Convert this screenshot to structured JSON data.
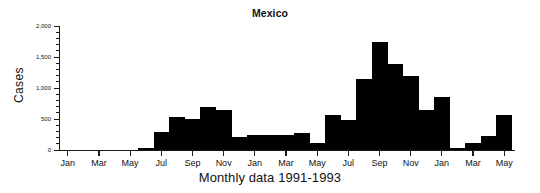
{
  "chart_data": {
    "type": "bar",
    "title": "Mexico",
    "xlabel": "Monthly data 1991-1993",
    "ylabel": "Cases",
    "ylim": [
      0,
      2000
    ],
    "ytick_labels": [
      "0",
      "500",
      "1,000",
      "1,500",
      "2,000"
    ],
    "ytick_values": [
      0,
      500,
      1000,
      1500,
      2000
    ],
    "yminor_step": 100,
    "grid": false,
    "legend": null,
    "categories": [
      "Jan 1991",
      "Feb 1991",
      "Mar 1991",
      "Apr 1991",
      "May 1991",
      "Jun 1991",
      "Jul 1991",
      "Aug 1991",
      "Sep 1991",
      "Oct 1991",
      "Nov 1991",
      "Dec 1991",
      "Jan 1992",
      "Feb 1992",
      "Mar 1992",
      "Apr 1992",
      "May 1992",
      "Jun 1992",
      "Jul 1992",
      "Aug 1992",
      "Sep 1992",
      "Oct 1992",
      "Nov 1992",
      "Dec 1992",
      "Jan 1993",
      "Feb 1993",
      "Mar 1993",
      "Apr 1993",
      "May 1993"
    ],
    "xtick_labels": [
      "Jan",
      "Mar",
      "May",
      "Jul",
      "Sep",
      "Nov",
      "Jan",
      "Mar",
      "May",
      "Jul",
      "Sep",
      "Nov",
      "Jan",
      "Mar",
      "May"
    ],
    "xtick_category_index": [
      0,
      2,
      4,
      6,
      8,
      10,
      12,
      14,
      16,
      18,
      20,
      22,
      24,
      26,
      28
    ],
    "values": [
      0,
      0,
      0,
      0,
      0,
      25,
      290,
      540,
      500,
      700,
      640,
      210,
      240,
      250,
      250,
      270,
      110,
      570,
      490,
      1150,
      1750,
      1390,
      1200,
      650,
      850,
      40,
      120,
      230,
      560
    ],
    "bar_color": "#000000",
    "axis_color": "#1a1a1a",
    "max_value": 1750,
    "max_category": "Sep 1992"
  }
}
